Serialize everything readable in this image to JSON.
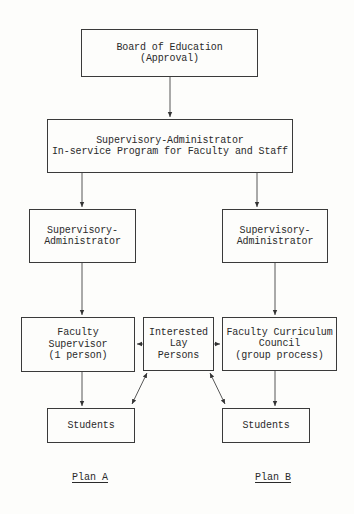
{
  "diagram": {
    "nodes": {
      "board": {
        "label": "Board of Education\n(Approval)"
      },
      "program": {
        "label": "Supervisory-Administrator\nIn-service Program for Faculty and Staff"
      },
      "sup_admin_a": {
        "label": "Supervisory-\nAdministrator"
      },
      "sup_admin_b": {
        "label": "Supervisory-\nAdministrator"
      },
      "faculty_supervisor": {
        "label": "Faculty\nSupervisor\n(1 person)"
      },
      "lay_persons": {
        "label": "Interested\nLay\nPersons"
      },
      "curriculum_council": {
        "label": "Faculty Curriculum\nCouncil\n(group process)"
      },
      "students_a": {
        "label": "Students"
      },
      "students_b": {
        "label": "Students"
      }
    },
    "edges": [
      {
        "from": "board",
        "to": "program",
        "type": "arrow"
      },
      {
        "from": "program",
        "to": "sup_admin_a",
        "type": "arrow"
      },
      {
        "from": "program",
        "to": "sup_admin_b",
        "type": "arrow"
      },
      {
        "from": "sup_admin_a",
        "to": "faculty_supervisor",
        "type": "arrow"
      },
      {
        "from": "sup_admin_b",
        "to": "curriculum_council",
        "type": "arrow"
      },
      {
        "from": "faculty_supervisor",
        "to": "students_a",
        "type": "arrow"
      },
      {
        "from": "curriculum_council",
        "to": "students_b",
        "type": "arrow"
      },
      {
        "from": "lay_persons",
        "to": "faculty_supervisor",
        "type": "arrow"
      },
      {
        "from": "lay_persons",
        "to": "curriculum_council",
        "type": "arrow"
      },
      {
        "from": "lay_persons",
        "to": "students_a",
        "type": "double-arrow"
      },
      {
        "from": "lay_persons",
        "to": "students_b",
        "type": "double-arrow"
      }
    ],
    "plans": {
      "a": "Plan A",
      "b": "Plan B"
    }
  }
}
